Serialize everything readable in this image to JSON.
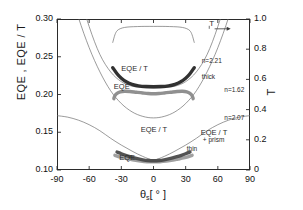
{
  "chart_data": {
    "type": "line",
    "title": "",
    "xlabel": "θ [ ° ]",
    "xlabel_symbol": "θ",
    "xlabel_sub": "s",
    "xlabel_unit": "[ ° ]",
    "ylabel_left": "EQE  ,  EQE / T",
    "ylabel_right": "T",
    "xlim": [
      -90,
      90
    ],
    "ylim_left": [
      0.1,
      0.3
    ],
    "ylim_right": [
      0.0,
      1.0
    ],
    "xticks": [
      "-90",
      "-60",
      "-30",
      "0",
      "30",
      "60",
      "90"
    ],
    "xtick_values": [
      -90,
      -60,
      -30,
      0,
      30,
      60,
      90
    ],
    "yticks_left": [
      "0.30",
      "0.25",
      "0.20",
      "0.15",
      "0.10"
    ],
    "ytick_left_values": [
      0.3,
      0.25,
      0.2,
      0.15,
      0.1
    ],
    "yticks_right": [
      "1.0",
      "0.8",
      "0.6",
      "0.4",
      "0.2",
      "0"
    ],
    "ytick_right_values": [
      1.0,
      0.8,
      0.6,
      0.4,
      0.2,
      0.0
    ],
    "grid": false,
    "legend": "inline-annotations",
    "annotations": [
      {
        "id": "t-curve-label",
        "text": "T",
        "x": 52,
        "y": 0.965,
        "note": "points to right axis via arrow"
      },
      {
        "id": "n221",
        "text": "n=2.21",
        "x": 45,
        "y": 0.243
      },
      {
        "id": "thick",
        "text": "thick",
        "x": 45,
        "y": 0.222
      },
      {
        "id": "n162",
        "text": "n=1.62",
        "x": 66,
        "y": 0.205
      },
      {
        "id": "n207",
        "text": "n=2.07",
        "x": 66,
        "y": 0.168
      },
      {
        "id": "eqe-over-t-upper",
        "text": "EQE / T",
        "x": -30,
        "y": 0.232
      },
      {
        "id": "eqe-upper",
        "text": "EQE",
        "x": -37,
        "y": 0.208
      },
      {
        "id": "eqe-over-t-lower",
        "text": "EQE / T",
        "x": -12,
        "y": 0.152
      },
      {
        "id": "eqe-lower",
        "text": "EQE",
        "x": -32,
        "y": 0.114
      },
      {
        "id": "eqe-over-t-prism",
        "text": "EQE / T",
        "x": 44,
        "y": 0.148
      },
      {
        "id": "prism",
        "text": "+ prism",
        "x": 46,
        "y": 0.138
      },
      {
        "id": "thin",
        "text": "thin",
        "x": 31,
        "y": 0.127
      }
    ],
    "series": [
      {
        "name": "T (transmission, right axis)",
        "axis": "right",
        "color": "#6b6b6b",
        "style": "thin-line",
        "x": [
          -38,
          -36,
          -34,
          -31,
          -27,
          -22,
          -15,
          -8,
          0,
          8,
          15,
          22,
          27,
          31,
          34,
          36,
          38
        ],
        "y": [
          0.845,
          0.895,
          0.922,
          0.936,
          0.944,
          0.948,
          0.95,
          0.951,
          0.951,
          0.951,
          0.95,
          0.948,
          0.944,
          0.936,
          0.922,
          0.895,
          0.845
        ]
      },
      {
        "name": "EQE/T thick (n=2.21) model, left axis",
        "axis": "left",
        "color": "#6b6b6b",
        "style": "thin-line",
        "x": [
          -90,
          -80,
          -70,
          -60,
          -50,
          -40,
          -30,
          -20,
          -10,
          0,
          10,
          20,
          30,
          40,
          50,
          60,
          70,
          80,
          90
        ],
        "y": [
          0.47,
          0.398,
          0.338,
          0.29,
          0.253,
          0.23,
          0.217,
          0.211,
          0.209,
          0.2085,
          0.209,
          0.211,
          0.217,
          0.23,
          0.253,
          0.29,
          0.338,
          0.398,
          0.47
        ]
      },
      {
        "name": "n=1.62 model, left axis",
        "axis": "left",
        "color": "#6b6b6b",
        "style": "thin-line",
        "x": [
          -90,
          -80,
          -70,
          -60,
          -50,
          -40,
          -30,
          -20,
          -10,
          0,
          10,
          20,
          30,
          40,
          50,
          60,
          70,
          80,
          90
        ],
        "y": [
          0.405,
          0.35,
          0.302,
          0.262,
          0.23,
          0.205,
          0.188,
          0.177,
          0.171,
          0.169,
          0.171,
          0.177,
          0.188,
          0.205,
          0.23,
          0.262,
          0.302,
          0.35,
          0.405
        ]
      },
      {
        "name": "n=2.07 EQE/T + prism, left axis",
        "axis": "left",
        "color": "#6b6b6b",
        "style": "thin-line",
        "x": [
          -90,
          -80,
          -70,
          -60,
          -50,
          -40,
          -30,
          -20,
          -10,
          0,
          10,
          20,
          30,
          40,
          50,
          60,
          70,
          80,
          90
        ],
        "y": [
          0.172,
          0.17,
          0.166,
          0.16,
          0.152,
          0.142,
          0.133,
          0.125,
          0.118,
          0.1135,
          0.118,
          0.125,
          0.133,
          0.142,
          0.152,
          0.16,
          0.166,
          0.17,
          0.172
        ]
      },
      {
        "name": "EQE / T thick measured (dark thick band)",
        "axis": "left",
        "color": "#262626",
        "style": "thick-band",
        "x": [
          -38,
          -34,
          -30,
          -25,
          -20,
          -14,
          -7,
          0,
          7,
          14,
          20,
          25,
          30,
          34,
          38
        ],
        "y": [
          0.2355,
          0.2275,
          0.2215,
          0.2165,
          0.2135,
          0.2115,
          0.2105,
          0.2103,
          0.2105,
          0.2115,
          0.2135,
          0.2165,
          0.2215,
          0.2275,
          0.2355
        ]
      },
      {
        "name": "EQE thick measured (grey thick band)",
        "axis": "left",
        "color": "#8a8a8a",
        "style": "thick-band",
        "x": [
          -37,
          -36,
          -34,
          -31,
          -27,
          -22,
          -16,
          -10,
          -5,
          0,
          5,
          10,
          16,
          22,
          27,
          31,
          34,
          36,
          37
        ],
        "y": [
          0.1945,
          0.1985,
          0.2015,
          0.2035,
          0.2043,
          0.204,
          0.203,
          0.202,
          0.2013,
          0.201,
          0.2013,
          0.202,
          0.203,
          0.204,
          0.2043,
          0.2035,
          0.2015,
          0.1985,
          0.1945
        ]
      },
      {
        "name": "EQE thin measured (grey thick band, bottom)",
        "axis": "left",
        "color": "#9b9b9b",
        "style": "thick-band",
        "x": [
          -36,
          -32,
          -28,
          -23,
          -18,
          -12,
          -6,
          0,
          6,
          12,
          18,
          23,
          28,
          32,
          36
        ],
        "y": [
          0.1195,
          0.1175,
          0.116,
          0.1145,
          0.113,
          0.1118,
          0.111,
          0.1107,
          0.111,
          0.1118,
          0.113,
          0.1145,
          0.116,
          0.1175,
          0.1195
        ]
      },
      {
        "name": "EQE/T thin measured (dark thick band, bottom)",
        "axis": "left",
        "color": "#4a4a4a",
        "style": "thick-band",
        "x": [
          -34,
          -30,
          -26,
          -21,
          -16,
          -10,
          -5,
          0,
          5,
          10,
          16,
          21,
          26,
          30,
          34
        ],
        "y": [
          0.1238,
          0.1215,
          0.1195,
          0.1173,
          0.1153,
          0.1135,
          0.1125,
          0.1122,
          0.1125,
          0.1135,
          0.1153,
          0.1173,
          0.1195,
          0.1215,
          0.1238
        ]
      }
    ],
    "arrow": {
      "id": "t-axis-arrow",
      "from_x": 57,
      "to_x": 72,
      "y": 0.935,
      "direction": "right"
    }
  }
}
